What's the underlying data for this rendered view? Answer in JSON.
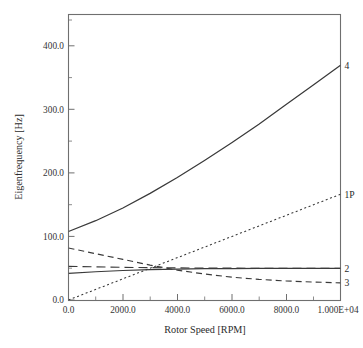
{
  "figure": {
    "background": "#ffffff",
    "frame_color": "#6f6f6f",
    "curve_color": "#3a3a3a"
  },
  "axes": {
    "x_title": "Rotor Speed [RPM]",
    "y_title": "Eigenfrequency [Hz]",
    "x_ticklabels": [
      "0.0",
      "2000.0",
      "4000.0",
      "6000.0",
      "8000.0",
      "1.000E+04"
    ],
    "y_ticklabels": [
      "0.0",
      "100.0",
      "200.0",
      "300.0",
      "400.0"
    ]
  },
  "labels": {
    "curve4": "4",
    "curve1p": "1P",
    "curve2": "2",
    "curve3": "3"
  },
  "chart_data": {
    "type": "line",
    "title": "",
    "subtitle": "",
    "xlabel": "Rotor Speed [RPM]",
    "ylabel": "Eigenfrequency [Hz]",
    "xlim": [
      0,
      10000
    ],
    "ylim": [
      0,
      450
    ],
    "xticks": [
      0,
      2000,
      4000,
      6000,
      8000,
      10000
    ],
    "xticklabels": [
      "0.0",
      "2000.0",
      "4000.0",
      "6000.0",
      "8000.0",
      "1.000E+04"
    ],
    "yticks": [
      0,
      100,
      200,
      300,
      400
    ],
    "yticklabels": [
      "0.0",
      "100.0",
      "200.0",
      "300.0",
      "400.0"
    ],
    "minor_ticks": true,
    "grid": false,
    "legend": "inline-end-labels",
    "legend_position": "right of curve ends, inside/edge of axes",
    "x": [
      0,
      1000,
      2000,
      3000,
      4000,
      5000,
      6000,
      7000,
      8000,
      9000,
      10000
    ],
    "series": [
      {
        "name": "4",
        "label": "4",
        "style": "solid",
        "values": [
          108,
          125,
          145,
          168,
          193,
          220,
          248,
          277,
          308,
          339,
          370
        ]
      },
      {
        "name": "1P",
        "label": "1P",
        "style": "dotted",
        "values": [
          0,
          16.7,
          33.3,
          50,
          66.7,
          83.3,
          100,
          116.7,
          133.3,
          150,
          166.7
        ]
      },
      {
        "name": "2",
        "label": "2",
        "style": "long-dash",
        "values": [
          53,
          52.2,
          51.5,
          51,
          50.6,
          50.4,
          50.2,
          50.1,
          50,
          50,
          50
        ]
      },
      {
        "name": "3",
        "label": "3",
        "style": "dashed",
        "values": [
          82,
          73,
          64,
          55,
          47,
          41,
          36,
          32.5,
          30,
          28.3,
          27
        ]
      },
      {
        "name": "unlabeled-lower-solid",
        "label": "",
        "style": "solid",
        "values": [
          42,
          44.5,
          46.5,
          48,
          48.8,
          49.3,
          49.6,
          49.8,
          49.9,
          50,
          50
        ]
      }
    ],
    "annotations": [
      {
        "text": "4",
        "x": 10000,
        "y": 370
      },
      {
        "text": "1P",
        "x": 10000,
        "y": 167
      },
      {
        "text": "2",
        "x": 10000,
        "y": 50
      },
      {
        "text": "3",
        "x": 10000,
        "y": 27
      }
    ]
  }
}
